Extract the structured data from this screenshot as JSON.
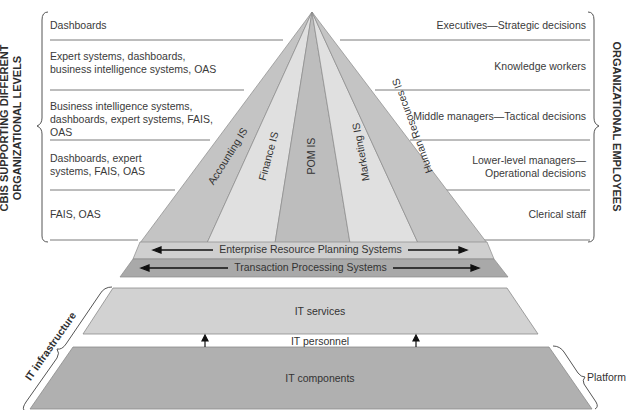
{
  "left_axis": {
    "title_line1": "CBIS SUPPORTING DIFFERENT",
    "title_line2": "ORGANIZATIONAL LEVELS",
    "levels": [
      {
        "text": "Dashboards"
      },
      {
        "text": "Expert systems, dashboards, business intelligence systems, OAS"
      },
      {
        "text": "Business intelligence systems, dashboards, expert systems, FAIS, OAS"
      },
      {
        "text": "Dashboards, expert systems, FAIS, OAS"
      },
      {
        "text": "FAIS, OAS"
      }
    ]
  },
  "right_axis": {
    "title": "ORGANIZATIONAL EMPLOYEES",
    "levels": [
      {
        "text": "Executives—Strategic decisions"
      },
      {
        "text": "Knowledge workers"
      },
      {
        "text": "Middle managers—Tactical decisions"
      },
      {
        "text": "Lower-level managers— Operational decisions"
      },
      {
        "text": "Clerical staff"
      }
    ]
  },
  "pyramid": {
    "segments": [
      {
        "label": "Accounting IS",
        "color": "#c4c4c4"
      },
      {
        "label": "Finance IS",
        "color": "#e0e0e0"
      },
      {
        "label": "POM IS",
        "color": "#bdbdbd"
      },
      {
        "label": "Marketing IS",
        "color": "#e0e0e0"
      },
      {
        "label": "Human Resources IS",
        "color": "#c4c4c4"
      }
    ],
    "erp_label": "Enterprise Resource Planning Systems",
    "tps_label": "Transaction Processing Systems",
    "erp_color": "#cfcfcf",
    "tps_color": "#a9a9a9"
  },
  "infrastructure": {
    "title": "IT infrastructure",
    "services_label": "IT services",
    "personnel_label": "IT personnel",
    "components_label": "IT components",
    "platform_label": "Platform",
    "services_color": "#d2d2d2",
    "components_color": "#b0b0b0"
  }
}
